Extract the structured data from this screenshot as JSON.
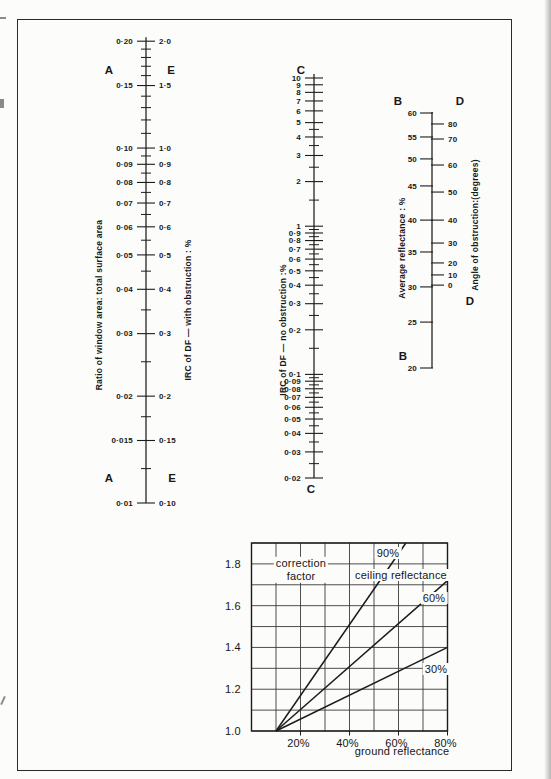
{
  "chart_data": {
    "type": "nomogram",
    "ink_color": "#1c1c1c",
    "paper_color": "#fcfcfb",
    "scales": {
      "AE": {
        "letter_left": "A",
        "letter_right": "E",
        "title_left": "Ratio of window area: total surface area",
        "title_right": "IRC of DF — with obstruction : %",
        "scale": "log",
        "range_left": [
          0.01,
          0.2
        ],
        "range_right": [
          0.1,
          2.0
        ],
        "ticks": [
          {
            "v": 0.2,
            "a": "0·20",
            "e": "2·0"
          },
          {
            "v": 0.15,
            "a": "0·15",
            "e": "1·5"
          },
          {
            "v": 0.1,
            "a": "0·10",
            "e": "1·0"
          },
          {
            "v": 0.09,
            "a": "0·09",
            "e": "0·9"
          },
          {
            "v": 0.08,
            "a": "0·08",
            "e": "0·8"
          },
          {
            "v": 0.07,
            "a": "0·07",
            "e": "0·7"
          },
          {
            "v": 0.06,
            "a": "0·06",
            "e": "0·6"
          },
          {
            "v": 0.05,
            "a": "0·05",
            "e": "0·5"
          },
          {
            "v": 0.04,
            "a": "0·04",
            "e": "0·4"
          },
          {
            "v": 0.03,
            "a": "0·03",
            "e": "0·3"
          },
          {
            "v": 0.02,
            "a": "0·02",
            "e": "0·2"
          },
          {
            "v": 0.015,
            "a": "0·015",
            "e": "0·15"
          },
          {
            "v": 0.01,
            "a": "0·01",
            "e": "0·10"
          }
        ],
        "minor_ticks": [
          0.19,
          0.18,
          0.17,
          0.16,
          0.14,
          0.13,
          0.12,
          0.11,
          0.095,
          0.085,
          0.075,
          0.065,
          0.055,
          0.045,
          0.035,
          0.025,
          0.0175,
          0.0125
        ]
      },
      "C": {
        "letter": "C",
        "title": "IRC of DF — no obstruction :%",
        "scale": "log",
        "range": [
          0.02,
          10
        ],
        "ticks": [
          {
            "v": 10,
            "label": "10"
          },
          {
            "v": 9,
            "label": "9"
          },
          {
            "v": 8,
            "label": "8"
          },
          {
            "v": 7,
            "label": "7"
          },
          {
            "v": 6,
            "label": "6"
          },
          {
            "v": 5,
            "label": "5"
          },
          {
            "v": 4,
            "label": "4"
          },
          {
            "v": 3,
            "label": "3"
          },
          {
            "v": 2,
            "label": "2"
          },
          {
            "v": 1,
            "label": "1"
          },
          {
            "v": 0.9,
            "label": "0·9"
          },
          {
            "v": 0.8,
            "label": "0·8"
          },
          {
            "v": 0.7,
            "label": "0·7"
          },
          {
            "v": 0.6,
            "label": "0·6"
          },
          {
            "v": 0.5,
            "label": "0·5"
          },
          {
            "v": 0.4,
            "label": "0·4"
          },
          {
            "v": 0.3,
            "label": "0·3"
          },
          {
            "v": 0.2,
            "label": "0·2"
          },
          {
            "v": 0.1,
            "label": "0·1"
          },
          {
            "v": 0.09,
            "label": "0·09"
          },
          {
            "v": 0.08,
            "label": "0·08"
          },
          {
            "v": 0.07,
            "label": "0·07"
          },
          {
            "v": 0.06,
            "label": "0·06"
          },
          {
            "v": 0.05,
            "label": "0·05"
          },
          {
            "v": 0.04,
            "label": "0·04"
          },
          {
            "v": 0.03,
            "label": "0·03"
          },
          {
            "v": 0.02,
            "label": "0·02"
          }
        ],
        "minor_ticks": [
          4.5,
          3.5,
          2.5,
          1.5,
          0.95,
          0.85,
          0.75,
          0.65,
          0.55,
          0.45,
          0.35,
          0.25,
          0.15,
          0.095,
          0.085,
          0.075,
          0.065,
          0.055,
          0.045,
          0.035,
          0.025
        ]
      },
      "BD": {
        "letter_left": "B",
        "letter_right": "D",
        "title_left": "Average reflectance : %",
        "title_right": "Angle of obstruction:(degrees)",
        "range_left": [
          20,
          60
        ],
        "range_right": [
          0,
          80
        ],
        "ticks_left": [
          {
            "label": "60",
            "t": 0
          },
          {
            "label": "55",
            "t": 0.094
          },
          {
            "label": "50",
            "t": 0.18
          },
          {
            "label": "45",
            "t": 0.286
          },
          {
            "label": "40",
            "t": 0.42
          },
          {
            "label": "35",
            "t": 0.545
          },
          {
            "label": "30",
            "t": 0.682
          },
          {
            "label": "25",
            "t": 0.82
          },
          {
            "label": "20",
            "t": 1
          }
        ],
        "ticks_right": [
          {
            "label": "80",
            "t": 0.043
          },
          {
            "label": "70",
            "t": 0.102
          },
          {
            "label": "60",
            "t": 0.204
          },
          {
            "label": "50",
            "t": 0.31
          },
          {
            "label": "40",
            "t": 0.42
          },
          {
            "label": "30",
            "t": 0.51
          },
          {
            "label": "20",
            "t": 0.588
          },
          {
            "label": "10",
            "t": 0.635
          },
          {
            "label": "0",
            "t": 0.675
          }
        ]
      }
    },
    "correction_chart": {
      "type": "line",
      "inline_title": "correction\nfactor",
      "legend_label": "ceiling reflectance",
      "xlabel": "ground reflectance",
      "x_tick_labels": [
        "20%",
        "40%",
        "60%",
        "80%"
      ],
      "x_tick_values": [
        20,
        40,
        60,
        80
      ],
      "y_tick_labels": [
        "1.0",
        "1.2",
        "1.4",
        "1.6",
        "1.8"
      ],
      "y_tick_values": [
        1.0,
        1.2,
        1.4,
        1.6,
        1.8
      ],
      "xlim": [
        0,
        80
      ],
      "ylim": [
        1.0,
        1.9
      ],
      "grid_step_x": 10,
      "grid_step_y": 0.1,
      "grid": true,
      "series": [
        {
          "name": "90%",
          "points": [
            [
              10,
              1.0
            ],
            [
              63,
              1.9
            ]
          ]
        },
        {
          "name": "60%",
          "points": [
            [
              10,
              1.0
            ],
            [
              80,
              1.72
            ]
          ]
        },
        {
          "name": "30%",
          "points": [
            [
              10,
              1.0
            ],
            [
              80,
              1.4
            ]
          ]
        }
      ]
    }
  }
}
